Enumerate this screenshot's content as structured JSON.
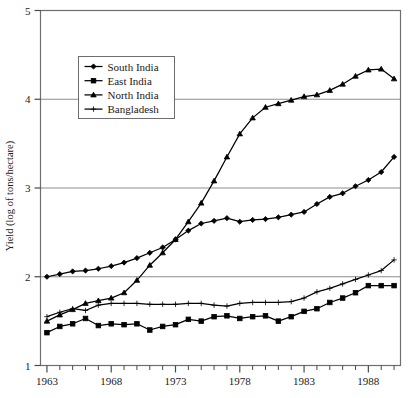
{
  "chart_data": {
    "type": "line",
    "title": "",
    "xlabel": "",
    "ylabel": "Yield (log of tons/hectare)",
    "xlim": [
      1962.5,
      1990.5
    ],
    "ylim": [
      1,
      5
    ],
    "yticks": [
      1,
      2,
      3,
      4,
      5
    ],
    "ytick_labels": [
      "1",
      "2",
      "3",
      "4",
      "5"
    ],
    "xticks": [
      1963,
      1964,
      1965,
      1966,
      1967,
      1968,
      1969,
      1970,
      1971,
      1972,
      1973,
      1974,
      1975,
      1976,
      1977,
      1978,
      1979,
      1980,
      1981,
      1982,
      1983,
      1984,
      1985,
      1986,
      1987,
      1988,
      1989,
      1990
    ],
    "xtick_labels_shown": [
      "1963",
      "1968",
      "1973",
      "1978",
      "1983",
      "1988"
    ],
    "xtick_labels_years": [
      1963,
      1968,
      1973,
      1978,
      1983,
      1988
    ],
    "grid": "horizontal-major",
    "gridlines_at": [
      2,
      3,
      4
    ],
    "legend_position": "upper-left-inset",
    "x": [
      1963,
      1964,
      1965,
      1966,
      1967,
      1968,
      1969,
      1970,
      1971,
      1972,
      1973,
      1974,
      1975,
      1976,
      1977,
      1978,
      1979,
      1980,
      1981,
      1982,
      1983,
      1984,
      1985,
      1986,
      1987,
      1988,
      1989,
      1990
    ],
    "series": [
      {
        "name": "South India",
        "marker": "diamond",
        "color": "#000000",
        "values": [
          2.0,
          2.03,
          2.06,
          2.07,
          2.09,
          2.12,
          2.16,
          2.21,
          2.27,
          2.33,
          2.42,
          2.52,
          2.6,
          2.63,
          2.66,
          2.62,
          2.64,
          2.65,
          2.67,
          2.7,
          2.73,
          2.82,
          2.9,
          2.94,
          3.02,
          3.09,
          3.18,
          3.35
        ]
      },
      {
        "name": "East India",
        "marker": "square",
        "color": "#000000",
        "values": [
          1.37,
          1.44,
          1.47,
          1.53,
          1.45,
          1.47,
          1.46,
          1.47,
          1.4,
          1.44,
          1.46,
          1.52,
          1.5,
          1.55,
          1.56,
          1.53,
          1.55,
          1.56,
          1.5,
          1.55,
          1.61,
          1.64,
          1.71,
          1.76,
          1.82,
          1.9,
          1.9,
          1.9
        ]
      },
      {
        "name": "North India",
        "marker": "triangle",
        "color": "#000000",
        "values": [
          1.5,
          1.57,
          1.63,
          1.7,
          1.73,
          1.76,
          1.82,
          1.96,
          2.13,
          2.27,
          2.42,
          2.62,
          2.83,
          3.08,
          3.35,
          3.61,
          3.79,
          3.91,
          3.95,
          3.99,
          4.03,
          4.05,
          4.1,
          4.17,
          4.26,
          4.33,
          4.34,
          4.23
        ]
      },
      {
        "name": "Bangladesh",
        "marker": "plus",
        "color": "#000000",
        "values": [
          1.55,
          1.6,
          1.64,
          1.62,
          1.68,
          1.7,
          1.7,
          1.7,
          1.69,
          1.69,
          1.69,
          1.7,
          1.7,
          1.68,
          1.67,
          1.7,
          1.71,
          1.71,
          1.71,
          1.72,
          1.76,
          1.83,
          1.87,
          1.92,
          1.97,
          2.02,
          2.07,
          2.19
        ]
      }
    ],
    "legend": [
      {
        "label": "South India",
        "marker": "diamond"
      },
      {
        "label": "East India",
        "marker": "square"
      },
      {
        "label": "North India",
        "marker": "triangle"
      },
      {
        "label": "Bangladesh",
        "marker": "plus"
      }
    ]
  }
}
